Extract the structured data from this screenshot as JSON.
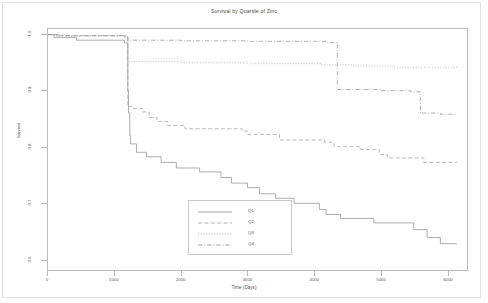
{
  "chart_data": {
    "type": "line",
    "title": "Survival by Quartile of Zinc",
    "xlabel": "Time (Days)",
    "ylabel": "Survival",
    "xlim": [
      0,
      6300
    ],
    "ylim": [
      0.58,
      1.01
    ],
    "xticks": [
      0,
      1000,
      2000,
      3000,
      4000,
      5000,
      6000
    ],
    "xtick_labels": [
      "0",
      "1000",
      "2000",
      "3000",
      "4000",
      "5000",
      "6000"
    ],
    "yticks": [
      0.6,
      0.7,
      0.8,
      0.9,
      1.0
    ],
    "ytick_labels": [
      "0.6",
      "0.7",
      "0.8",
      "0.9",
      "1.0"
    ],
    "grid": false,
    "legend_position": "lower center",
    "step_style": "post",
    "series": [
      {
        "name": "Q1",
        "label": "Q1",
        "dash": "solid",
        "color": "#8a8a8a",
        "points": [
          [
            0,
            1.0
          ],
          [
            90,
            0.995
          ],
          [
            430,
            0.99
          ],
          [
            1150,
            0.985
          ],
          [
            1200,
            0.9
          ],
          [
            1210,
            0.86
          ],
          [
            1230,
            0.82
          ],
          [
            1240,
            0.805
          ],
          [
            1330,
            0.79
          ],
          [
            1480,
            0.782
          ],
          [
            1700,
            0.772
          ],
          [
            1930,
            0.762
          ],
          [
            2280,
            0.755
          ],
          [
            2600,
            0.745
          ],
          [
            2760,
            0.735
          ],
          [
            3000,
            0.727
          ],
          [
            3180,
            0.716
          ],
          [
            3420,
            0.708
          ],
          [
            3700,
            0.699
          ],
          [
            4080,
            0.688
          ],
          [
            4180,
            0.679
          ],
          [
            4400,
            0.672
          ],
          [
            4900,
            0.664
          ],
          [
            5500,
            0.652
          ],
          [
            5700,
            0.638
          ],
          [
            5900,
            0.627
          ],
          [
            6150,
            0.627
          ]
        ]
      },
      {
        "name": "Q2",
        "label": "Q2",
        "dash": "dashed",
        "color": "#9a9a9a",
        "points": [
          [
            0,
            1.0
          ],
          [
            150,
            0.998
          ],
          [
            1150,
            0.995
          ],
          [
            1200,
            0.872
          ],
          [
            1260,
            0.868
          ],
          [
            1420,
            0.862
          ],
          [
            1520,
            0.852
          ],
          [
            1640,
            0.845
          ],
          [
            1800,
            0.838
          ],
          [
            2060,
            0.832
          ],
          [
            2920,
            0.828
          ],
          [
            3000,
            0.822
          ],
          [
            3480,
            0.812
          ],
          [
            4160,
            0.808
          ],
          [
            4300,
            0.8
          ],
          [
            4700,
            0.795
          ],
          [
            4980,
            0.786
          ],
          [
            5100,
            0.78
          ],
          [
            5650,
            0.772
          ],
          [
            6150,
            0.772
          ]
        ]
      },
      {
        "name": "Q3",
        "label": "Q3",
        "dash": "dotted",
        "color": "#9f9f9f",
        "points": [
          [
            0,
            1.0
          ],
          [
            250,
            0.998
          ],
          [
            1180,
            0.996
          ],
          [
            1200,
            0.952
          ],
          [
            2000,
            0.95
          ],
          [
            3000,
            0.948
          ],
          [
            4100,
            0.946
          ],
          [
            4600,
            0.944
          ],
          [
            5200,
            0.942
          ],
          [
            6150,
            0.942
          ]
        ]
      },
      {
        "name": "Q4",
        "label": "Q4",
        "dash": "dashdot",
        "color": "#8f8f8f",
        "points": [
          [
            0,
            1.0
          ],
          [
            120,
            0.998
          ],
          [
            1180,
            0.996
          ],
          [
            1200,
            0.99
          ],
          [
            2000,
            0.989
          ],
          [
            3000,
            0.988
          ],
          [
            4200,
            0.986
          ],
          [
            4350,
            0.902
          ],
          [
            5000,
            0.9
          ],
          [
            5450,
            0.898
          ],
          [
            5600,
            0.86
          ],
          [
            5900,
            0.858
          ],
          [
            6150,
            0.858
          ]
        ]
      }
    ]
  },
  "legend": {
    "entries": [
      {
        "label": "Q1"
      },
      {
        "label": "Q2"
      },
      {
        "label": "Q3"
      },
      {
        "label": "Q4"
      }
    ]
  }
}
